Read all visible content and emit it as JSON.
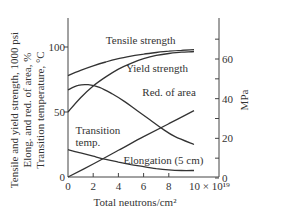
{
  "chart_data": {
    "type": "line",
    "title": "",
    "xlabel": "Total neutrons/cm²",
    "x_multiplier_label": "× 10¹⁹",
    "ylabel_left_lines": [
      "Tensile and yield strength, 1000 psi",
      "Elong. and red. of area, %",
      "Transition temperature, °C"
    ],
    "ylabel_right": "MPa",
    "xlim": [
      0,
      10
    ],
    "ylim_left": [
      0,
      100
    ],
    "ylim_right": [
      0,
      70
    ],
    "x_ticks": [
      "0",
      "2",
      "4",
      "6",
      "8",
      "10"
    ],
    "x_tick_values": [
      0,
      2,
      4,
      6,
      8,
      10
    ],
    "y_left_ticks": [
      "0",
      "50",
      "100"
    ],
    "y_left_tick_values": [
      0,
      50,
      100
    ],
    "y_right_ticks": [
      "0",
      "20",
      "40",
      "60"
    ],
    "y_right_tick_values": [
      0,
      20,
      40,
      60
    ],
    "y_right_minor_ticks": [
      10,
      30,
      50,
      70
    ],
    "grid": false,
    "legend": "inline labels",
    "series": [
      {
        "name": "Tensile strength",
        "x": [
          0,
          1,
          2,
          3,
          4,
          5,
          6,
          7,
          8,
          9,
          10
        ],
        "values": [
          78,
          82,
          85.5,
          88.5,
          91,
          93,
          94.5,
          95.8,
          96.8,
          97.5,
          98
        ]
      },
      {
        "name": "Yield strength",
        "x": [
          0,
          1,
          2,
          3,
          4,
          5,
          6,
          7,
          8,
          9,
          10
        ],
        "values": [
          50,
          61,
          70,
          77,
          83,
          87.5,
          91,
          93.5,
          95,
          96,
          96.5
        ]
      },
      {
        "name": "Red. of area",
        "x": [
          0,
          0.8,
          1.6,
          2.5,
          3.5,
          4.5,
          5.5,
          6.5,
          7.5,
          8.5,
          10
        ],
        "values": [
          67,
          70.5,
          71,
          69,
          64,
          58,
          51,
          44,
          37,
          31,
          25
        ]
      },
      {
        "name": "Transition temp.",
        "x": [
          0,
          2,
          4,
          6,
          8,
          10
        ],
        "values": [
          0,
          10,
          20.5,
          31,
          41,
          51
        ]
      },
      {
        "name": "Elongation (5 cm)",
        "x": [
          0,
          1,
          2,
          3,
          4,
          5,
          6,
          7,
          8,
          9,
          10
        ],
        "values": [
          21,
          18.5,
          16,
          13.5,
          11.5,
          9.5,
          8,
          6.5,
          5.5,
          5,
          5
        ]
      }
    ],
    "annotations": [
      {
        "text": "Tensile strength",
        "x": 3.0,
        "y": 102
      },
      {
        "text": "Yield strength",
        "x": 4.6,
        "y": 81
      },
      {
        "text": "Red. of area",
        "x": 5.9,
        "y": 62
      },
      {
        "text": "Transition",
        "x": 0.6,
        "y": 33
      },
      {
        "text": "temp.",
        "x": 0.6,
        "y": 24
      },
      {
        "text": "Elongation (5 cm)",
        "x": 4.4,
        "y": 10
      }
    ]
  }
}
